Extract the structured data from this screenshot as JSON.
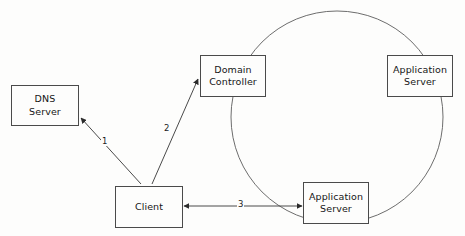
{
  "diagram": {
    "background_color": "#fdfdfc",
    "stroke_color": "#4a4a4a",
    "text_color": "#161616",
    "nodes": [
      {
        "id": "dns-server",
        "label": "DNS\nServer"
      },
      {
        "id": "domain-controller",
        "label": "Domain\nController"
      },
      {
        "id": "application-server-top",
        "label": "Application\nServer"
      },
      {
        "id": "client",
        "label": "Client"
      },
      {
        "id": "application-server-bottom",
        "label": "Application\nServer"
      }
    ],
    "edges": [
      {
        "id": "edge-1",
        "label": "1",
        "from": "client",
        "to": "dns-server",
        "direction": "one-way"
      },
      {
        "id": "edge-2",
        "label": "2",
        "from": "client",
        "to": "domain-controller",
        "direction": "one-way"
      },
      {
        "id": "edge-3",
        "label": "3",
        "from": "client",
        "to": "application-server-bottom",
        "direction": "two-way"
      }
    ],
    "boundary": {
      "id": "trust-boundary-circle",
      "shape": "circle"
    }
  }
}
